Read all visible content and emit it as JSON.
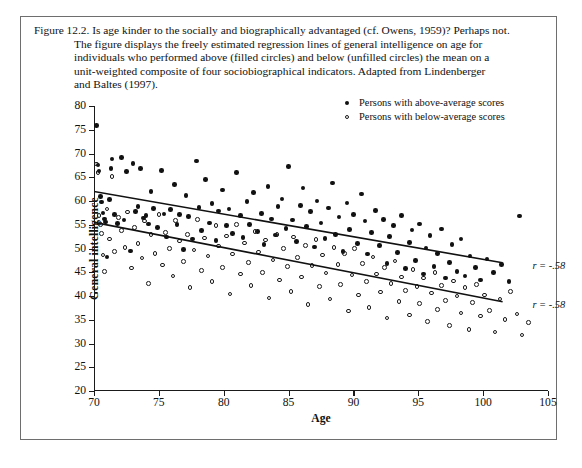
{
  "figure": {
    "number": "Figure 12.2.",
    "caption_lines": [
      "Figure 12.2. Is age kinder to the socially and biographically advantaged (cf. Owens, 1959)? Perhaps not.",
      "The figure displays the freely estimated regression lines of general intelligence on age for",
      "individuals who performed above (filled circles) and below (unfilled circles) the mean on a",
      "unit-weighted composite of four sociobiographical indicators. Adapted from Lindenberger",
      "and Baltes (1997)."
    ]
  },
  "legend": {
    "position": "top-right",
    "entries": [
      {
        "marker": "filled-circle-icon",
        "label": "Persons with above-average scores"
      },
      {
        "marker": "open-circle-icon",
        "label": "Persons with below-average scores"
      }
    ]
  },
  "annotations": [
    {
      "text": "r = -.58",
      "series": "above-average",
      "x": 103.8,
      "y": 46.5
    },
    {
      "text": "r = -.58",
      "series": "below-average",
      "x": 103.8,
      "y": 38.3
    }
  ],
  "chart_data": {
    "type": "scatter",
    "title": "",
    "xlabel": "Age",
    "ylabel": "General intelligence",
    "xlim": [
      70,
      105
    ],
    "ylim": [
      20,
      80
    ],
    "xticks": [
      70,
      75,
      80,
      85,
      90,
      95,
      100,
      105
    ],
    "yticks": [
      20,
      25,
      30,
      35,
      40,
      45,
      50,
      55,
      60,
      65,
      70,
      75,
      80
    ],
    "grid": false,
    "series": [
      {
        "name": "Persons with above-average scores",
        "marker": "filled-circle",
        "color": "#111111",
        "regression": {
          "x1": 70,
          "y1": 62.0,
          "x2": 101.5,
          "y2": 47.0,
          "r": -0.58
        },
        "points": [
          [
            70.2,
            75.9
          ],
          [
            70.3,
            67.6
          ],
          [
            70.4,
            66.3
          ],
          [
            70.5,
            61.0
          ],
          [
            70.6,
            59.8
          ],
          [
            70.7,
            57.5
          ],
          [
            70.8,
            56.2
          ],
          [
            70.9,
            55.6
          ],
          [
            71.0,
            48.2
          ],
          [
            71.2,
            60.3
          ],
          [
            71.3,
            66.8
          ],
          [
            71.4,
            68.8
          ],
          [
            71.6,
            57.1
          ],
          [
            71.8,
            55.3
          ],
          [
            72.1,
            69.2
          ],
          [
            72.3,
            56.0
          ],
          [
            72.5,
            66.2
          ],
          [
            72.8,
            49.5
          ],
          [
            73.0,
            67.9
          ],
          [
            73.2,
            57.8
          ],
          [
            73.4,
            58.9
          ],
          [
            73.6,
            66.8
          ],
          [
            73.8,
            56.4
          ],
          [
            74.0,
            57.0
          ],
          [
            74.2,
            55.2
          ],
          [
            74.4,
            62.0
          ],
          [
            74.6,
            58.4
          ],
          [
            74.9,
            54.4
          ],
          [
            75.2,
            66.4
          ],
          [
            75.4,
            57.3
          ],
          [
            75.6,
            52.4
          ],
          [
            75.9,
            58.2
          ],
          [
            76.2,
            63.5
          ],
          [
            76.4,
            55.0
          ],
          [
            76.6,
            57.1
          ],
          [
            76.9,
            49.8
          ],
          [
            77.1,
            61.2
          ],
          [
            77.3,
            56.7
          ],
          [
            77.6,
            52.0
          ],
          [
            77.9,
            68.4
          ],
          [
            78.1,
            58.6
          ],
          [
            78.3,
            53.8
          ],
          [
            78.6,
            64.5
          ],
          [
            78.9,
            55.4
          ],
          [
            79.1,
            59.5
          ],
          [
            79.4,
            51.7
          ],
          [
            79.6,
            57.9
          ],
          [
            79.9,
            62.3
          ],
          [
            80.2,
            54.8
          ],
          [
            80.4,
            58.3
          ],
          [
            80.7,
            53.2
          ],
          [
            81.0,
            66.0
          ],
          [
            81.3,
            56.9
          ],
          [
            81.5,
            52.3
          ],
          [
            81.8,
            59.9
          ],
          [
            82.0,
            55.1
          ],
          [
            82.3,
            61.8
          ],
          [
            82.6,
            53.6
          ],
          [
            82.9,
            57.4
          ],
          [
            83.1,
            50.9
          ],
          [
            83.4,
            63.0
          ],
          [
            83.7,
            56.2
          ],
          [
            84.0,
            52.8
          ],
          [
            84.2,
            58.9
          ],
          [
            84.5,
            60.4
          ],
          [
            84.8,
            54.2
          ],
          [
            85.0,
            67.3
          ],
          [
            85.3,
            56.0
          ],
          [
            85.6,
            51.5
          ],
          [
            85.9,
            59.1
          ],
          [
            86.1,
            62.7
          ],
          [
            86.4,
            54.6
          ],
          [
            86.7,
            57.8
          ],
          [
            87.0,
            50.3
          ],
          [
            87.2,
            60.0
          ],
          [
            87.5,
            55.4
          ],
          [
            87.8,
            52.1
          ],
          [
            88.1,
            58.5
          ],
          [
            88.4,
            63.8
          ],
          [
            88.6,
            53.0
          ],
          [
            88.9,
            56.6
          ],
          [
            89.2,
            49.4
          ],
          [
            89.5,
            59.6
          ],
          [
            89.7,
            54.0
          ],
          [
            90.0,
            57.2
          ],
          [
            90.3,
            51.0
          ],
          [
            90.6,
            61.5
          ],
          [
            90.9,
            55.8
          ],
          [
            91.1,
            48.8
          ],
          [
            91.4,
            53.4
          ],
          [
            91.7,
            58.0
          ],
          [
            92.0,
            50.6
          ],
          [
            92.3,
            56.1
          ],
          [
            92.6,
            46.9
          ],
          [
            92.8,
            52.5
          ],
          [
            93.1,
            54.9
          ],
          [
            93.4,
            49.1
          ],
          [
            93.7,
            57.0
          ],
          [
            94.0,
            45.8
          ],
          [
            94.3,
            51.3
          ],
          [
            94.5,
            53.9
          ],
          [
            94.8,
            47.5
          ],
          [
            95.1,
            55.2
          ],
          [
            95.4,
            44.6
          ],
          [
            95.6,
            50.1
          ],
          [
            95.9,
            52.7
          ],
          [
            96.2,
            46.2
          ],
          [
            96.5,
            48.9
          ],
          [
            96.8,
            54.1
          ],
          [
            97.1,
            43.8
          ],
          [
            97.4,
            47.0
          ],
          [
            97.6,
            50.8
          ],
          [
            98.0,
            45.1
          ],
          [
            98.3,
            52.0
          ],
          [
            98.6,
            44.2
          ],
          [
            99.0,
            48.4
          ],
          [
            99.4,
            46.0
          ],
          [
            99.8,
            43.4
          ],
          [
            100.3,
            47.8
          ],
          [
            100.8,
            44.9
          ],
          [
            101.4,
            46.6
          ],
          [
            102.0,
            43.1
          ],
          [
            102.8,
            56.8
          ]
        ]
      },
      {
        "name": "Persons with below-average scores",
        "marker": "open-circle",
        "color": "#1a1a1a",
        "regression": {
          "x1": 70,
          "y1": 55.5,
          "x2": 101.5,
          "y2": 38.8,
          "r": -0.58
        },
        "points": [
          [
            70.2,
            67.8
          ],
          [
            70.3,
            66.0
          ],
          [
            70.4,
            56.9
          ],
          [
            70.5,
            55.0
          ],
          [
            70.6,
            53.1
          ],
          [
            70.7,
            48.6
          ],
          [
            70.8,
            45.2
          ],
          [
            71.0,
            58.3
          ],
          [
            71.2,
            52.0
          ],
          [
            71.4,
            65.1
          ],
          [
            71.6,
            49.4
          ],
          [
            71.9,
            56.5
          ],
          [
            72.1,
            53.8
          ],
          [
            72.4,
            50.2
          ],
          [
            72.6,
            57.7
          ],
          [
            72.9,
            45.9
          ],
          [
            73.1,
            54.4
          ],
          [
            73.4,
            51.1
          ],
          [
            73.7,
            48.0
          ],
          [
            73.9,
            55.8
          ],
          [
            74.2,
            42.6
          ],
          [
            74.4,
            52.9
          ],
          [
            74.7,
            49.0
          ],
          [
            75.0,
            57.2
          ],
          [
            75.3,
            46.5
          ],
          [
            75.5,
            53.4
          ],
          [
            75.8,
            50.0
          ],
          [
            76.1,
            44.2
          ],
          [
            76.3,
            55.9
          ],
          [
            76.6,
            51.6
          ],
          [
            76.9,
            47.3
          ],
          [
            77.2,
            53.0
          ],
          [
            77.4,
            41.8
          ],
          [
            77.7,
            49.7
          ],
          [
            78.0,
            56.1
          ],
          [
            78.3,
            45.4
          ],
          [
            78.5,
            52.2
          ],
          [
            78.8,
            48.4
          ],
          [
            79.1,
            43.0
          ],
          [
            79.4,
            54.8
          ],
          [
            79.6,
            50.5
          ],
          [
            79.9,
            46.0
          ],
          [
            80.2,
            52.6
          ],
          [
            80.5,
            40.4
          ],
          [
            80.7,
            48.8
          ],
          [
            81.0,
            55.0
          ],
          [
            81.3,
            44.6
          ],
          [
            81.6,
            51.2
          ],
          [
            81.9,
            47.0
          ],
          [
            82.1,
            42.2
          ],
          [
            82.4,
            53.6
          ],
          [
            82.7,
            49.3
          ],
          [
            83.0,
            45.0
          ],
          [
            83.2,
            51.8
          ],
          [
            83.5,
            39.6
          ],
          [
            83.8,
            47.6
          ],
          [
            84.1,
            53.0
          ],
          [
            84.3,
            43.4
          ],
          [
            84.6,
            50.0
          ],
          [
            84.9,
            46.2
          ],
          [
            85.2,
            41.0
          ],
          [
            85.4,
            52.4
          ],
          [
            85.7,
            48.1
          ],
          [
            86.0,
            44.0
          ],
          [
            86.3,
            50.6
          ],
          [
            86.5,
            38.2
          ],
          [
            86.8,
            46.4
          ],
          [
            87.1,
            51.9
          ],
          [
            87.4,
            42.0
          ],
          [
            87.6,
            48.6
          ],
          [
            87.9,
            44.8
          ],
          [
            88.2,
            39.4
          ],
          [
            88.5,
            50.2
          ],
          [
            88.8,
            46.6
          ],
          [
            89.0,
            42.4
          ],
          [
            89.3,
            48.9
          ],
          [
            89.6,
            36.8
          ],
          [
            89.9,
            44.4
          ],
          [
            90.1,
            50.0
          ],
          [
            90.4,
            40.2
          ],
          [
            90.7,
            46.8
          ],
          [
            91.0,
            43.0
          ],
          [
            91.2,
            37.6
          ],
          [
            91.5,
            48.2
          ],
          [
            91.8,
            44.6
          ],
          [
            92.1,
            40.8
          ],
          [
            92.4,
            46.0
          ],
          [
            92.6,
            35.4
          ],
          [
            92.9,
            42.6
          ],
          [
            93.2,
            47.4
          ],
          [
            93.5,
            38.8
          ],
          [
            93.7,
            44.0
          ],
          [
            94.0,
            41.2
          ],
          [
            94.3,
            36.0
          ],
          [
            94.6,
            45.6
          ],
          [
            94.9,
            42.0
          ],
          [
            95.1,
            38.4
          ],
          [
            95.4,
            43.8
          ],
          [
            95.7,
            34.6
          ],
          [
            96.0,
            40.6
          ],
          [
            96.3,
            45.0
          ],
          [
            96.5,
            37.2
          ],
          [
            96.8,
            42.2
          ],
          [
            97.1,
            39.0
          ],
          [
            97.4,
            33.8
          ],
          [
            97.7,
            43.2
          ],
          [
            98.0,
            40.0
          ],
          [
            98.3,
            36.4
          ],
          [
            98.6,
            41.8
          ],
          [
            98.9,
            33.0
          ],
          [
            99.2,
            38.6
          ],
          [
            99.5,
            42.4
          ],
          [
            99.8,
            35.8
          ],
          [
            100.1,
            40.2
          ],
          [
            100.5,
            37.0
          ],
          [
            100.9,
            32.4
          ],
          [
            101.3,
            39.4
          ],
          [
            101.7,
            35.0
          ],
          [
            102.1,
            41.0
          ],
          [
            102.6,
            36.2
          ],
          [
            103.0,
            31.8
          ],
          [
            103.5,
            34.4
          ]
        ]
      }
    ]
  }
}
